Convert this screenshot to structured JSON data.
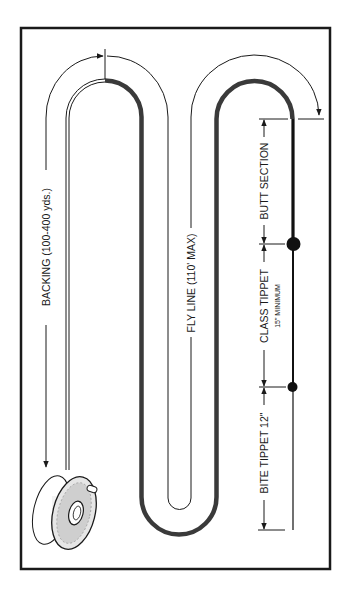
{
  "colors": {
    "background": "#ffffff",
    "frame": "#1a1a1a",
    "fly_line": "#3a3a3a",
    "ink": "#1a1a1a"
  },
  "labels": {
    "backing": "BACKING (100-400 yds.)",
    "fly_line": "FLY LINE (110' MAX)",
    "butt_section": "BUTT SECTION",
    "class_tippet": "CLASS TIPPET",
    "class_tippet_note": "15\" MINIMUM",
    "bite_tippet": "BITE TIPPET 12\""
  },
  "components": [
    {
      "name": "reel",
      "icon": "fly-reel-icon"
    },
    {
      "name": "backing",
      "length": "100-400 yds."
    },
    {
      "name": "fly line",
      "length": "110' MAX"
    },
    {
      "name": "butt section"
    },
    {
      "name": "class tippet",
      "length": "15\" MINIMUM"
    },
    {
      "name": "bite tippet",
      "length": "12\""
    }
  ],
  "knots": [
    {
      "between": [
        "butt section",
        "class tippet"
      ],
      "size": "large"
    },
    {
      "between": [
        "class tippet",
        "bite tippet"
      ],
      "size": "small"
    }
  ]
}
